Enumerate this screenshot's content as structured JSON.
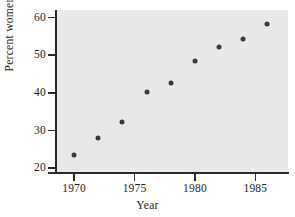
{
  "chart_data": {
    "type": "scatter",
    "title": "",
    "xlabel": "Year",
    "ylabel": "Percent women",
    "xlim": [
      1968.5,
      1987.7
    ],
    "ylim": [
      19.0,
      62.0
    ],
    "grid": false,
    "legend": null,
    "xticks": [
      1970,
      1975,
      1980,
      1985
    ],
    "xtick_labels": [
      "1970",
      "1975",
      "1980",
      "1985"
    ],
    "xminor_ticks": [],
    "yticks": [
      20,
      30,
      40,
      50,
      60
    ],
    "ytick_labels": [
      "20",
      "30",
      "40",
      "50",
      "60"
    ],
    "x": [
      1970,
      1972,
      1974,
      1976,
      1978,
      1980,
      1982,
      1984,
      1986
    ],
    "y": [
      23.5,
      28.0,
      32.3,
      40.2,
      42.5,
      48.5,
      52.3,
      54.4,
      58.4
    ],
    "points": [
      {
        "x": 1970,
        "y": 23.5
      },
      {
        "x": 1972,
        "y": 28.0
      },
      {
        "x": 1974,
        "y": 32.3
      },
      {
        "x": 1976,
        "y": 40.2
      },
      {
        "x": 1978,
        "y": 42.5
      },
      {
        "x": 1980,
        "y": 48.5
      },
      {
        "x": 1982,
        "y": 52.3
      },
      {
        "x": 1984,
        "y": 54.4
      },
      {
        "x": 1986,
        "y": 58.4
      }
    ],
    "marker": "filled-circle",
    "marker_color": "#3a3a3a",
    "plot_background_color": "#e9e9e9",
    "axis_color": "#2b2b2b",
    "figure_background_color": "#ffffff"
  }
}
